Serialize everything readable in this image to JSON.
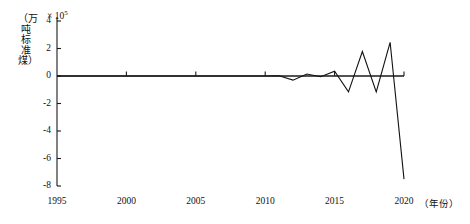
{
  "chart_data": {
    "type": "line",
    "title": "",
    "subtitle": "",
    "xlabel": "（年份）",
    "ylabel": "（万吨标准煤）",
    "y_exponent_label": "× 10",
    "y_exponent_power": "5",
    "xlim": [
      1995,
      2020
    ],
    "ylim": [
      -8,
      4
    ],
    "y_scale_factor": 100000,
    "grid": false,
    "legend": null,
    "x_ticks": [
      "1995",
      "2000",
      "2005",
      "2010",
      "2015",
      "2020"
    ],
    "x_tick_values": [
      1995,
      2000,
      2005,
      2010,
      2015,
      2020
    ],
    "y_ticks": [
      "4",
      "2",
      "0",
      "-2",
      "-4",
      "-6",
      "-8"
    ],
    "y_tick_values": [
      4,
      2,
      0,
      -2,
      -4,
      -6,
      -8
    ],
    "x": [
      1995,
      1996,
      1997,
      1998,
      1999,
      2000,
      2001,
      2002,
      2003,
      2004,
      2005,
      2006,
      2007,
      2008,
      2009,
      2010,
      2011,
      2012,
      2013,
      2014,
      2015,
      2016,
      2017,
      2018,
      2019,
      2020
    ],
    "values": [
      0.0,
      0.0,
      0.0,
      0.0,
      0.0,
      0.0,
      0.0,
      0.0,
      0.0,
      0.0,
      0.0,
      0.0,
      0.0,
      0.0,
      0.0,
      0.0,
      0.02,
      -0.3,
      0.14,
      -0.05,
      0.35,
      -1.15,
      1.78,
      -1.16,
      2.45,
      -7.5
    ],
    "zero_line": 0
  },
  "axis": {
    "x_unit_label": "（年份）"
  }
}
